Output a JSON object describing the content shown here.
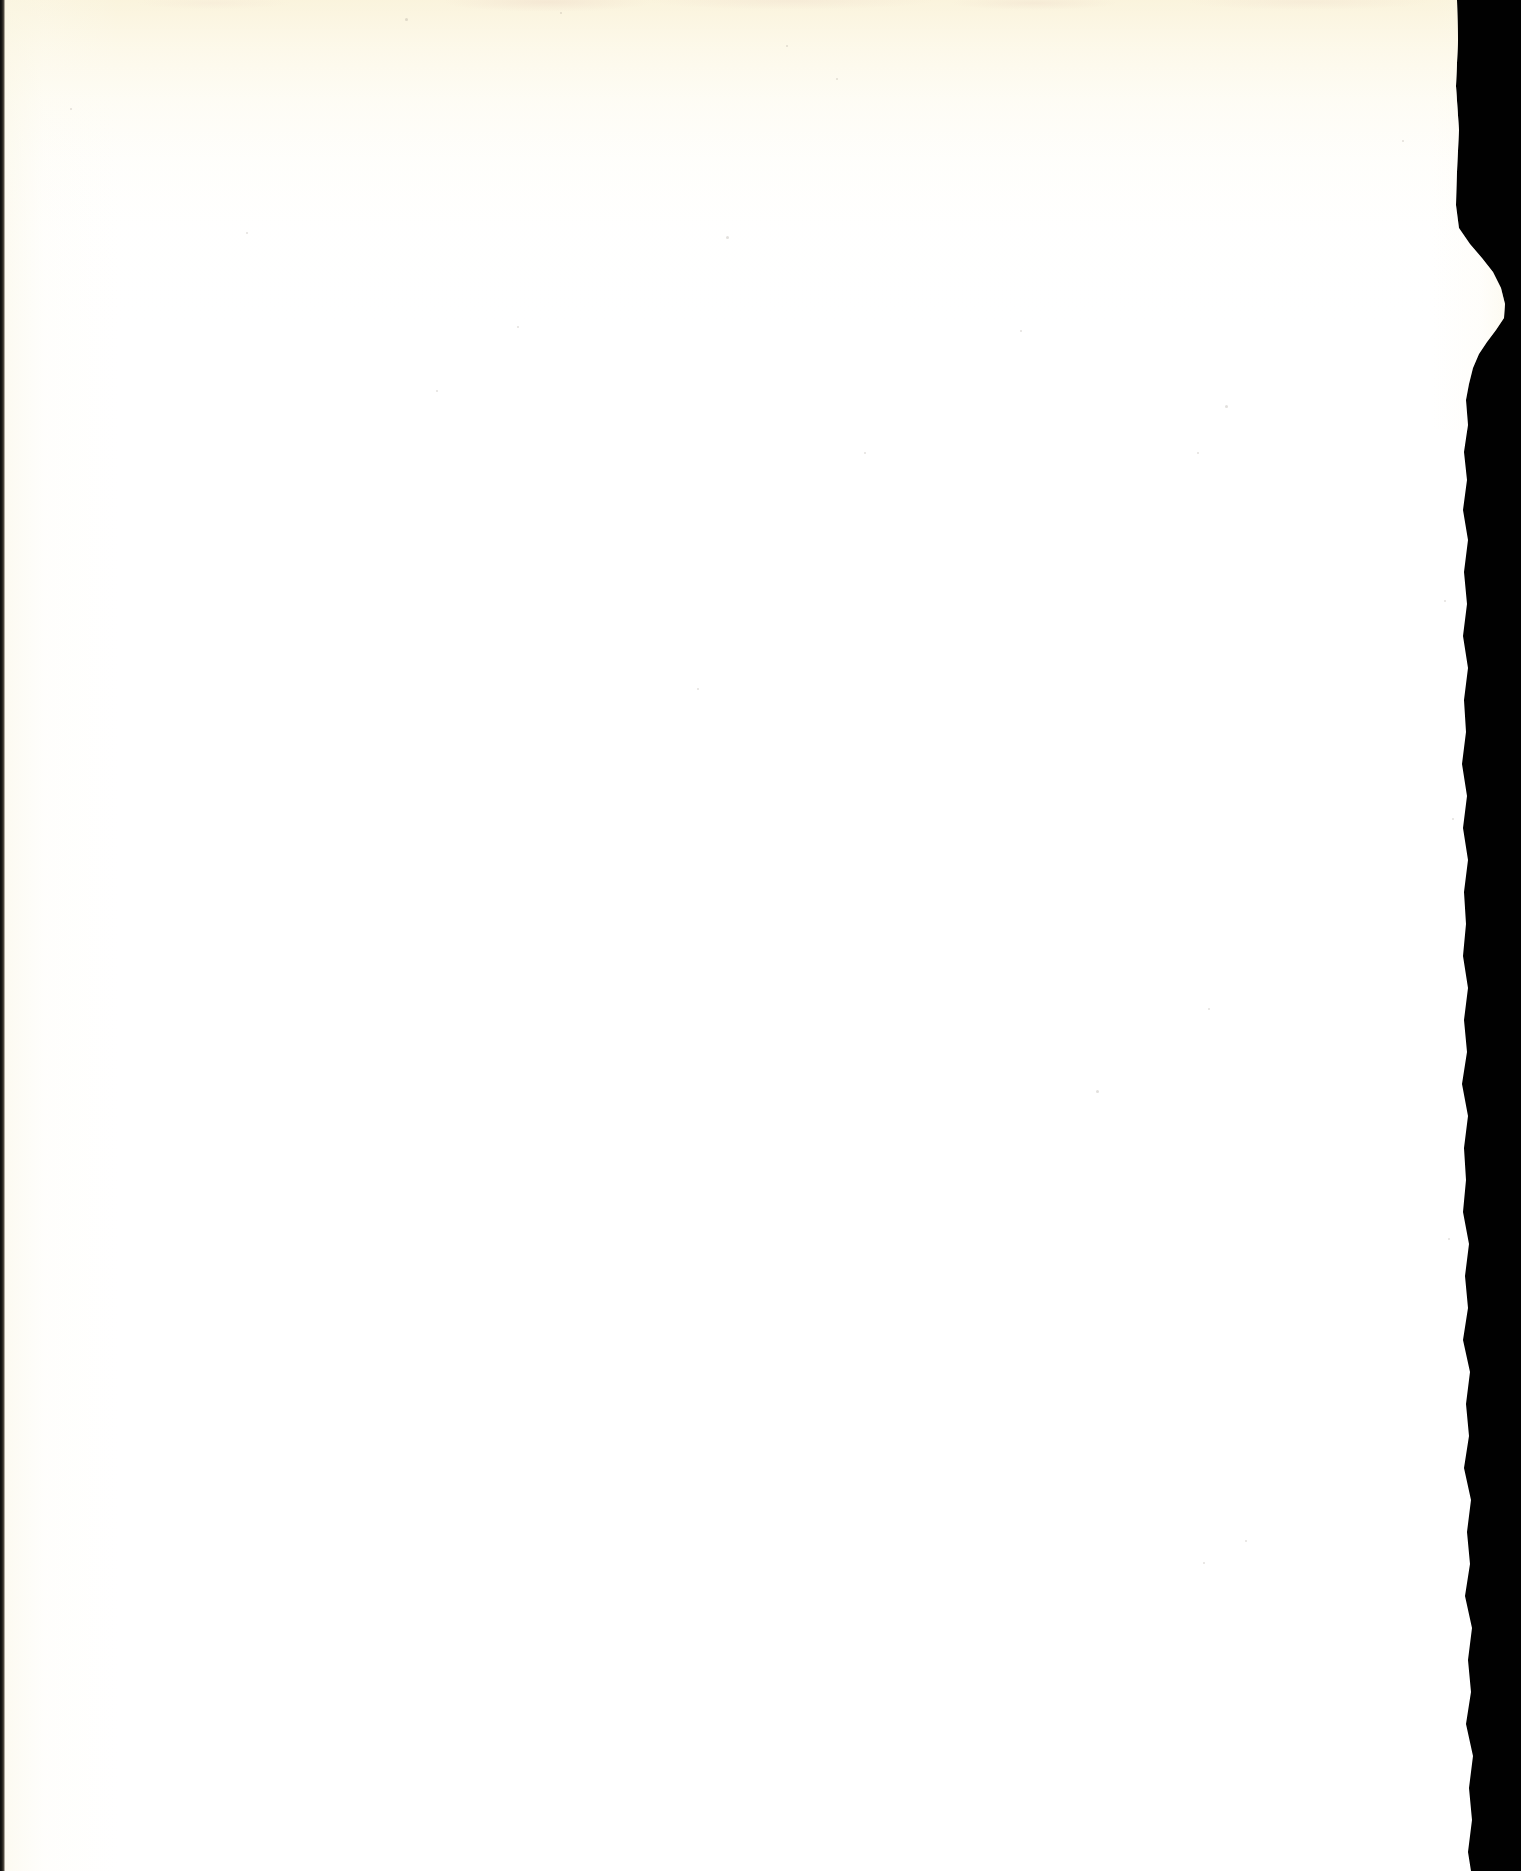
{
  "document": {
    "type": "scanned-page",
    "title": "Blank scanned page",
    "page_content_text": "",
    "has_visible_text": false,
    "orientation": "portrait",
    "width_px": 1521,
    "height_px": 1871
  },
  "paper": {
    "label": "Blank page",
    "description": "Blank leaf of a scanned book with no printed text or images",
    "base_color": "#ffffff",
    "top_tint_color": "#faf3db",
    "mottle_color": "#ecd6c6",
    "left_gutter_color": "#faf6e4",
    "edge_style": "torn-deckled-right-edge"
  },
  "backdrop": {
    "label": "Scanner backdrop",
    "color": "#010101"
  },
  "left_edge": {
    "label": "Binding gutter shadow",
    "color": "#0a0a0a",
    "width_px": 5
  },
  "right_edge": {
    "label": "Torn right edge",
    "nominal_x_px": 1465,
    "tear_peak_x_px": 1505,
    "tear_peak_y_px": 304,
    "tear_start_y_px": 228,
    "tear_end_y_px": 400
  },
  "speckles": [
    {
      "x": 405,
      "y": 18,
      "size": 3
    },
    {
      "x": 560,
      "y": 12,
      "size": 2
    },
    {
      "x": 786,
      "y": 45,
      "size": 2
    },
    {
      "x": 836,
      "y": 78,
      "size": 2
    },
    {
      "x": 246,
      "y": 232,
      "size": 2
    },
    {
      "x": 726,
      "y": 236,
      "size": 3
    },
    {
      "x": 517,
      "y": 326,
      "size": 2
    },
    {
      "x": 436,
      "y": 390,
      "size": 2
    },
    {
      "x": 1020,
      "y": 330,
      "size": 2
    },
    {
      "x": 1225,
      "y": 405,
      "size": 3
    },
    {
      "x": 864,
      "y": 452,
      "size": 2
    },
    {
      "x": 1197,
      "y": 452,
      "size": 2
    },
    {
      "x": 697,
      "y": 688,
      "size": 2
    },
    {
      "x": 1096,
      "y": 1090,
      "size": 3
    },
    {
      "x": 1208,
      "y": 1008,
      "size": 2
    },
    {
      "x": 1245,
      "y": 1540,
      "size": 2
    },
    {
      "x": 1203,
      "y": 1562,
      "size": 2
    },
    {
      "x": 1444,
      "y": 600,
      "size": 2
    },
    {
      "x": 1452,
      "y": 818,
      "size": 2
    },
    {
      "x": 1448,
      "y": 1238,
      "size": 2
    },
    {
      "x": 70,
      "y": 108,
      "size": 2
    },
    {
      "x": 1402,
      "y": 140,
      "size": 2
    }
  ]
}
